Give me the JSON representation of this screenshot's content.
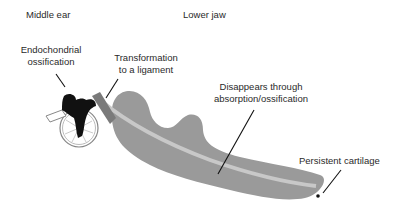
{
  "diagram": {
    "type": "anatomical-schematic",
    "headers": {
      "middle_ear": "Middle ear",
      "lower_jaw": "Lower jaw"
    },
    "annotations": {
      "endochondral_line1": "Endochondrial",
      "endochondral_line2": "ossification",
      "ligament_line1": "Transformation",
      "ligament_line2": "to a ligament",
      "disappears_line1": "Disappears through",
      "disappears_line2": "absorption/ossification",
      "persistent": "Persistent cartilage"
    },
    "colors": {
      "jaw_fill": "#9a9a9a",
      "cartilage_band": "#c8c8c8",
      "ossicle_fill": "#111111",
      "ligament_fill": "#7a7a7a",
      "leader_lines": "#111111"
    }
  }
}
